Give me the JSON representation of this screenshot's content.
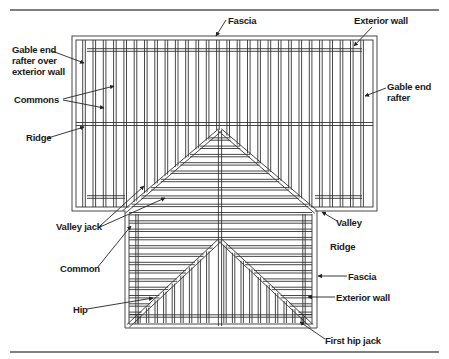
{
  "diagram": {
    "labels": {
      "fascia_top": "Fascia",
      "exterior_wall_top": "Exterior wall",
      "gable_end_over_wall": [
        "Gable end",
        "rafter over",
        "exterior wall"
      ],
      "commons": "Commons",
      "ridge_left": "Ridge",
      "gable_end_rafter": [
        "Gable end",
        "rafter"
      ],
      "valley_jack": "Valley jack",
      "common": "Common",
      "hip": "Hip",
      "valley": "Valley",
      "ridge_right": "Ridge",
      "fascia_right": "Fascia",
      "exterior_wall_right": "Exterior wall",
      "first_hip_jack": "First hip jack"
    },
    "colors": {
      "line": "#333333",
      "text": "#1a1a1a",
      "rule": "#444444"
    }
  }
}
